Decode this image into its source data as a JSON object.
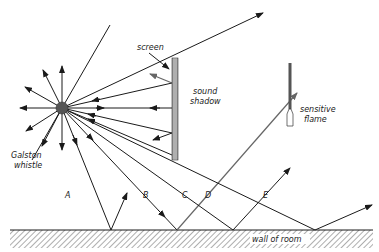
{
  "figure": {
    "type": "physics-diagram"
  },
  "labels": {
    "screen": "screen",
    "sound_shadow_line1": "sound",
    "sound_shadow_line2": "shadow",
    "sensitive_flame_line1": "sensitive",
    "sensitive_flame_line2": "flame",
    "galston_whistle_line1": "Galston",
    "galston_whistle_line2": "whistle",
    "wall": "wall of room",
    "ray_a": "A",
    "ray_b": "B",
    "ray_c": "C",
    "ray_d": "D",
    "ray_e": "E"
  },
  "colors": {
    "line": "#1a1a1a",
    "source_fill": "#555555",
    "screen_fill": "#9a9a9a",
    "reflected_gray": "#666666",
    "background": "#ffffff"
  }
}
